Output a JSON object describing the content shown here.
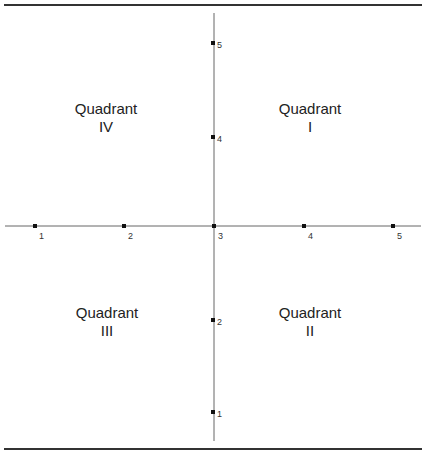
{
  "diagram": {
    "type": "quadrant-axes",
    "quadrants": [
      {
        "id": "q1",
        "title": "Quadrant",
        "numeral": "I",
        "position": "top-right"
      },
      {
        "id": "q2",
        "title": "Quadrant",
        "numeral": "II",
        "position": "bottom-right"
      },
      {
        "id": "q3",
        "title": "Quadrant",
        "numeral": "III",
        "position": "bottom-left"
      },
      {
        "id": "q4",
        "title": "Quadrant",
        "numeral": "IV",
        "position": "top-left"
      }
    ],
    "x_axis": {
      "ticks": [
        "1",
        "2",
        "3",
        "4",
        "5"
      ]
    },
    "y_axis": {
      "ticks": [
        "1",
        "2",
        "4",
        "5"
      ]
    },
    "colors": {
      "axis": "#666666",
      "rule": "#333333",
      "marker": "#111111"
    }
  }
}
